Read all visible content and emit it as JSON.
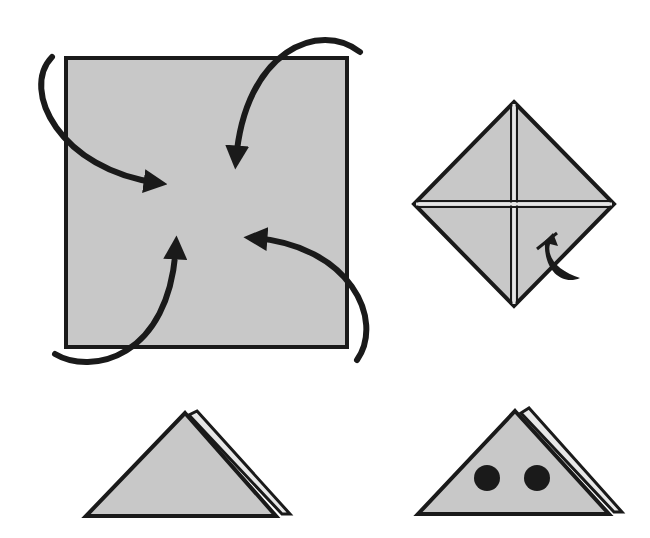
{
  "diagram": {
    "type": "origami-instructions",
    "colors": {
      "paper": "#c8c8c8",
      "outline": "#1a1a1a",
      "background": "#ffffff",
      "crease": "#e6e6e6"
    },
    "steps": [
      {
        "id": "step-1",
        "description": "Square paper with four curved arrows folding corners to center"
      },
      {
        "id": "step-2",
        "description": "Diamond with creases; bottom corner folded back"
      },
      {
        "id": "step-3",
        "description": "Folded triangle with layered right edge"
      },
      {
        "id": "step-4",
        "description": "Folded triangle with two dots for eyes"
      }
    ]
  }
}
